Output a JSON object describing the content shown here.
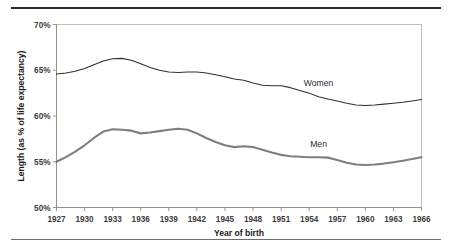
{
  "chart_data": {
    "type": "line",
    "title": "",
    "xlabel": "Year of birth",
    "ylabel": "Length (as % of life expectancy)",
    "xlim": [
      1927,
      1966
    ],
    "ylim": [
      50,
      70
    ],
    "ytick_labels": [
      "50%",
      "55%",
      "60%",
      "65%",
      "70%"
    ],
    "ytick_values": [
      50,
      55,
      60,
      65,
      70
    ],
    "xtick_labels": [
      "1927",
      "1930",
      "1933",
      "1936",
      "1939",
      "1942",
      "1945",
      "1948",
      "1951",
      "1954",
      "1957",
      "1960",
      "1963",
      "1966"
    ],
    "xtick_values": [
      1927,
      1930,
      1933,
      1936,
      1939,
      1942,
      1945,
      1948,
      1951,
      1954,
      1957,
      1960,
      1963,
      1966
    ],
    "grid": false,
    "legend_position": "inline-annotations",
    "x": [
      1927,
      1928,
      1929,
      1930,
      1931,
      1932,
      1933,
      1934,
      1935,
      1936,
      1937,
      1938,
      1939,
      1940,
      1941,
      1942,
      1943,
      1944,
      1945,
      1946,
      1947,
      1948,
      1949,
      1950,
      1951,
      1952,
      1953,
      1954,
      1955,
      1956,
      1957,
      1958,
      1959,
      1960,
      1961,
      1962,
      1963,
      1964,
      1965,
      1966
    ],
    "series": [
      {
        "name": "Women",
        "color": "#2f2f2f",
        "line_width": "thin",
        "label_x": 1955,
        "label_y": 63.3,
        "values": [
          64.6,
          64.7,
          64.9,
          65.2,
          65.6,
          66.0,
          66.25,
          66.3,
          66.1,
          65.7,
          65.3,
          65.0,
          64.8,
          64.75,
          64.8,
          64.8,
          64.7,
          64.5,
          64.3,
          64.05,
          63.9,
          63.6,
          63.35,
          63.3,
          63.3,
          63.1,
          62.8,
          62.5,
          62.1,
          61.85,
          61.65,
          61.4,
          61.2,
          61.15,
          61.2,
          61.3,
          61.4,
          61.5,
          61.65,
          61.8
        ]
      },
      {
        "name": "Men",
        "color": "#7f7f7f",
        "line_width": "thick",
        "label_x": 1955,
        "label_y": 56.6,
        "values": [
          55.0,
          55.5,
          56.1,
          56.8,
          57.6,
          58.3,
          58.55,
          58.5,
          58.4,
          58.1,
          58.2,
          58.35,
          58.5,
          58.6,
          58.5,
          58.1,
          57.6,
          57.15,
          56.8,
          56.6,
          56.7,
          56.6,
          56.3,
          56.0,
          55.75,
          55.6,
          55.55,
          55.5,
          55.5,
          55.45,
          55.2,
          54.9,
          54.7,
          54.65,
          54.7,
          54.8,
          54.95,
          55.1,
          55.3,
          55.5
        ]
      }
    ]
  },
  "figure": {
    "top_rule": "",
    "bottom_rule": ""
  }
}
